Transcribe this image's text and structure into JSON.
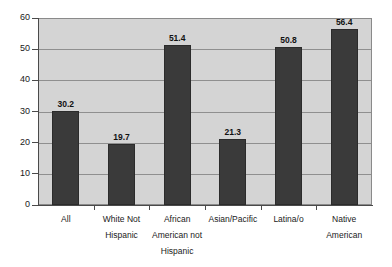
{
  "chart_data": {
    "type": "bar",
    "title": "",
    "subtitle": "",
    "xlabel": "",
    "ylabel": "",
    "ylim": [
      0,
      60
    ],
    "yticks": [
      "0",
      "10",
      "20",
      "30",
      "40",
      "50",
      "60"
    ],
    "grid": true,
    "legend": "none",
    "categories": [
      "All",
      "White Not Hispanic",
      "African American not Hispanic",
      "Asian/Pacific",
      "Latina/o",
      "Native American"
    ],
    "category_lines": [
      [
        "All"
      ],
      [
        "White Not",
        "Hispanic"
      ],
      [
        "African",
        "American not",
        "Hispanic"
      ],
      [
        "Asian/Pacific"
      ],
      [
        "Latina/o"
      ],
      [
        "Native",
        "American"
      ]
    ],
    "values": [
      30.2,
      19.7,
      51.4,
      21.3,
      50.8,
      56.4
    ],
    "value_labels": [
      "30.2",
      "19.7",
      "51.4",
      "21.3",
      "50.8",
      "56.4"
    ],
    "colors": {
      "bar_fill": "#3a3a3a",
      "bar_border": "#2b2b2b",
      "plot_background": "#d4d4d4",
      "gridline": "#8f8f8f",
      "axis": "#4a4a4a",
      "page_background": "#ffffff",
      "text": "#1a1a1a"
    }
  }
}
